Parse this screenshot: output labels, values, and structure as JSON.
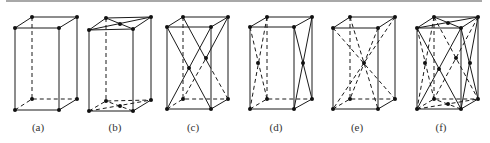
{
  "figure": {
    "panels": [
      {
        "id": "a",
        "label": "(a)",
        "type": "simple",
        "extra_points": []
      },
      {
        "id": "b",
        "label": "(b)",
        "type": "base-centered",
        "extra_points": [
          "top-face-center",
          "bottom-face-center"
        ]
      },
      {
        "id": "c",
        "label": "(c)",
        "type": "front-back-face-centered",
        "extra_points": [
          "front-face-center",
          "back-face-center"
        ]
      },
      {
        "id": "d",
        "label": "(d)",
        "type": "side-face-centered",
        "extra_points": [
          "left-face-center",
          "right-face-center"
        ]
      },
      {
        "id": "e",
        "label": "(e)",
        "type": "body-centered",
        "extra_points": [
          "body-center"
        ]
      },
      {
        "id": "f",
        "label": "(f)",
        "type": "face-centered",
        "extra_points": [
          "top-face-center",
          "bottom-face-center",
          "front-face-center",
          "back-face-center",
          "left-face-center",
          "right-face-center"
        ]
      }
    ]
  },
  "colors": {
    "line": "#1a1a1a",
    "point": "#111111",
    "label": "#333333"
  }
}
